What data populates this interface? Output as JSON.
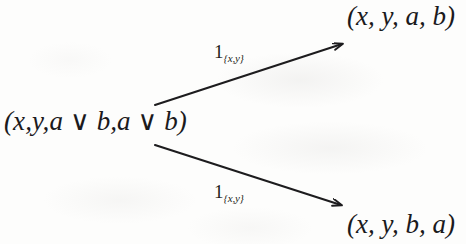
{
  "diagram": {
    "kind": "commutative-diagram",
    "background_color": "#fdfdfc",
    "ink_color": "#1d1c1e",
    "nodes": {
      "source": {
        "label": "(x,y,a ∨ b,a ∨ b)",
        "position": "left-middle"
      },
      "target_top": {
        "label": "(x, y, a, b)",
        "position": "top-right"
      },
      "target_bottom": {
        "label": "(x, y, b, a)",
        "position": "bottom-right"
      }
    },
    "edges": [
      {
        "name": "upper-arrow",
        "from": "source",
        "to": "target_top",
        "label_main": "1",
        "label_sub": "{x,y}",
        "x1": 155,
        "y1": 105,
        "x2": 348,
        "y2": 42
      },
      {
        "name": "lower-arrow",
        "from": "source",
        "to": "target_bottom",
        "label_main": "1",
        "label_sub": "{x,y}",
        "x1": 155,
        "y1": 145,
        "x2": 348,
        "y2": 208
      }
    ]
  }
}
